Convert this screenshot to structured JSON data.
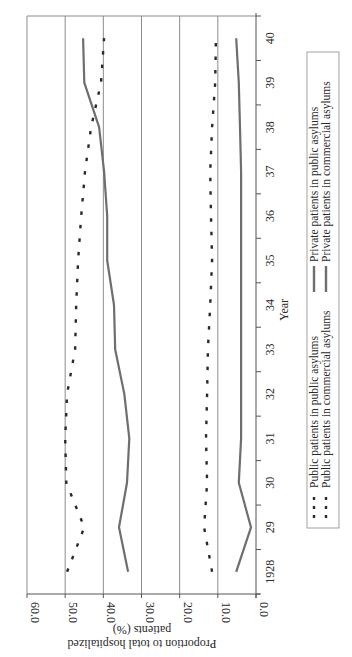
{
  "chart_data": {
    "type": "line",
    "orientation": "rotated-90-clockwise",
    "title": "",
    "xlabel": "Year",
    "ylabel": "Proportion to total hospitalized patients (%)",
    "ylabel_lines": [
      "Proportion to total hospitalized",
      "patients (%)"
    ],
    "ylim": [
      0,
      60
    ],
    "yticks": [
      0,
      10,
      20,
      30,
      40,
      50,
      60
    ],
    "ytick_labels": [
      "0.0",
      "10.0",
      "20.0",
      "30.0",
      "40.0",
      "50.0",
      "60.0"
    ],
    "categories": [
      "1928",
      "29",
      "30",
      "31",
      "32",
      "33",
      "34",
      "35",
      "36",
      "37",
      "38",
      "39",
      "40"
    ],
    "grid": true,
    "legend_position": "bottom",
    "series": [
      {
        "name": "Public patients in public asylums",
        "style": "dashed",
        "color": "#2a2a2a",
        "values": [
          49.5,
          45.0,
          49.7,
          50.0,
          49.5,
          47.4,
          47.1,
          46.6,
          45.8,
          44.8,
          43.2,
          40.6,
          39.8
        ]
      },
      {
        "name": "Public patients in commercial asylums",
        "style": "dashed",
        "color": "#2a2a2a",
        "values": [
          11.5,
          13.6,
          12.8,
          13.1,
          12.8,
          12.6,
          12.0,
          11.5,
          11.8,
          12.0,
          11.5,
          10.7,
          10.5
        ]
      },
      {
        "name": "Private patients in public asylums",
        "style": "solid",
        "color": "#6e6e6e",
        "values": [
          5.2,
          1.3,
          4.5,
          3.9,
          3.9,
          3.9,
          3.9,
          3.9,
          3.9,
          3.9,
          4.2,
          4.5,
          5.2
        ]
      },
      {
        "name": "Private patients in commercial asylums",
        "style": "solid",
        "color": "#6e6e6e",
        "values": [
          33.5,
          35.9,
          33.8,
          33.2,
          34.5,
          36.9,
          37.2,
          39.0,
          39.0,
          39.8,
          41.1,
          45.0,
          45.3
        ]
      }
    ],
    "legend": [
      {
        "label": "Public patients in public asylums",
        "style": "dashed"
      },
      {
        "label": "Public patients in commercial asylums",
        "style": "dashed"
      },
      {
        "label": "Private patients in public asylums",
        "style": "solid"
      },
      {
        "label": "Private patients in commercial asylums",
        "style": "solid"
      }
    ]
  }
}
